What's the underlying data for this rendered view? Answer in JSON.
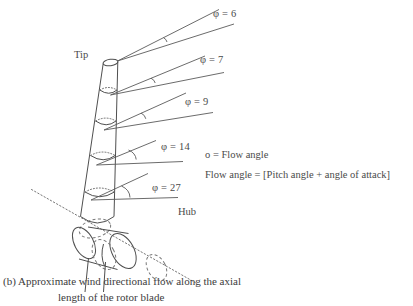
{
  "figure": {
    "caption_line1": "(b) Approximate wind directional flow along the axial",
    "caption_line2": "length of the rotor blade"
  },
  "labels": {
    "tip": "Tip",
    "hub": "Hub"
  },
  "legend": {
    "line1": "o = Flow angle",
    "line2": "Flow angle = [Pitch angle + angle of attack]"
  },
  "flow_angles": [
    {
      "id": "phi-6",
      "text": "φ = 6",
      "symbol": "φ",
      "value": 6
    },
    {
      "id": "phi-7",
      "text": "φ = 7",
      "symbol": "φ",
      "value": 7
    },
    {
      "id": "phi-9",
      "text": "φ = 9",
      "symbol": "φ",
      "value": 9
    },
    {
      "id": "phi-14",
      "text": "φ = 14",
      "symbol": "φ",
      "value": 14
    },
    {
      "id": "phi-27",
      "text": "φ = 27",
      "symbol": "φ",
      "value": 27
    }
  ],
  "colors": {
    "line": "#4f4f4f",
    "dashed": "#777777",
    "text": "#4a4a4a",
    "background": "#ffffff"
  }
}
